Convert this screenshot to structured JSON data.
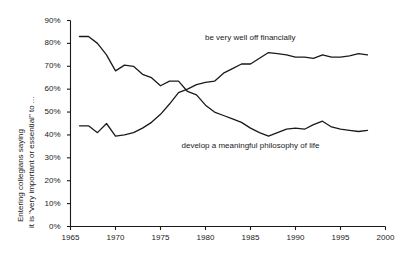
{
  "chart_data": {
    "type": "line",
    "title": "",
    "xlabel": "",
    "ylabel": "Entering collegians saying it is \"very important or essential\" to ...",
    "ylabel_line1": "Entering collegians saying",
    "ylabel_line2": "it is \"very important or essential\" to ...",
    "xlim": [
      1965,
      2000
    ],
    "ylim": [
      0,
      90
    ],
    "grid": false,
    "legend_position": "inline-annotations",
    "yticks": [
      "0%",
      "10%",
      "20%",
      "30%",
      "40%",
      "50%",
      "60%",
      "70%",
      "80%",
      "90%"
    ],
    "ytick_values": [
      0,
      10,
      20,
      30,
      40,
      50,
      60,
      70,
      80,
      90
    ],
    "xticks": [
      "1965",
      "1970",
      "1975",
      "1980",
      "1985",
      "1990",
      "1995",
      "2000"
    ],
    "xtick_values": [
      1965,
      1970,
      1975,
      1980,
      1985,
      1990,
      1995,
      2000
    ],
    "line_color": "#1a1a1a",
    "series": [
      {
        "name": "be very well off financially",
        "annotation": "be very well off financially",
        "annotation_x": 1985.0,
        "annotation_y": 82.5,
        "x": [
          1966,
          1967,
          1968,
          1969,
          1970,
          1971,
          1972,
          1973,
          1974,
          1975,
          1976,
          1977,
          1978,
          1979,
          1980,
          1981,
          1982,
          1983,
          1984,
          1985,
          1986,
          1987,
          1988,
          1989,
          1990,
          1991,
          1992,
          1993,
          1994,
          1995,
          1996,
          1997,
          1998
        ],
        "values": [
          44.0,
          44.0,
          41.0,
          45.0,
          39.5,
          40.0,
          41.0,
          43.0,
          45.5,
          49.0,
          53.5,
          58.5,
          60.0,
          62.0,
          63.0,
          63.5,
          67.0,
          69.0,
          71.0,
          71.0,
          73.5,
          76.0,
          75.5,
          75.0,
          74.0,
          74.0,
          73.5,
          75.0,
          74.0,
          74.0,
          74.5,
          75.5,
          75.0
        ]
      },
      {
        "name": "develop a meaningful philosophy of life",
        "annotation": "develop a meaningful philosophy of life",
        "annotation_x": 1985.0,
        "annotation_y": 35.0,
        "x": [
          1966,
          1967,
          1968,
          1969,
          1970,
          1971,
          1972,
          1973,
          1974,
          1975,
          1976,
          1977,
          1978,
          1979,
          1980,
          1981,
          1982,
          1983,
          1984,
          1985,
          1986,
          1987,
          1988,
          1989,
          1990,
          1991,
          1992,
          1993,
          1994,
          1995,
          1996,
          1997,
          1998
        ],
        "values": [
          83.0,
          83.0,
          80.0,
          75.0,
          68.0,
          70.5,
          70.0,
          66.5,
          65.0,
          61.5,
          63.5,
          63.5,
          59.0,
          57.5,
          53.0,
          50.0,
          48.5,
          47.0,
          45.5,
          43.0,
          41.0,
          39.5,
          41.0,
          42.5,
          43.0,
          42.5,
          44.5,
          46.0,
          43.5,
          42.5,
          42.0,
          41.5,
          42.0
        ]
      }
    ]
  }
}
